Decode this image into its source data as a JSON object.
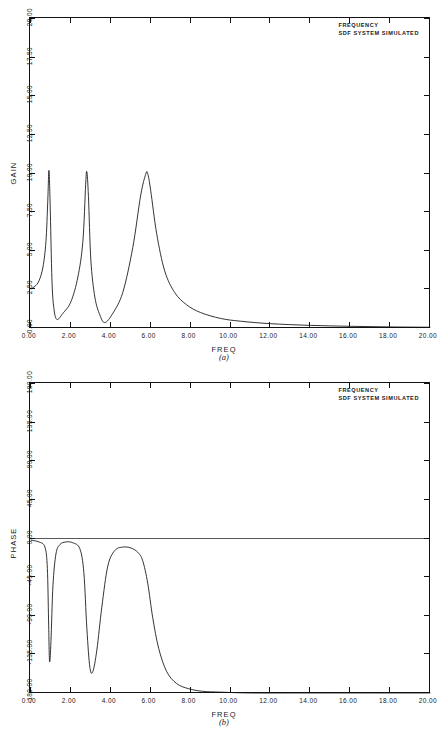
{
  "figure": {
    "caption_a": "(a)",
    "caption_b": "(b)"
  },
  "panel_a": {
    "title_line1": "FREQUENCY",
    "title_line2": "SDF SYSTEM SIMULATED",
    "xlabel": "FREQ",
    "ylabel": "GAIN",
    "xticks": [
      "0.00",
      "2.00",
      "4.00",
      "6.00",
      "8.00",
      "10.00",
      "12.00",
      "14.00",
      "16.00",
      "18.00",
      "20.00"
    ],
    "yticks": [
      "0.00",
      "2.50",
      "5.00",
      "7.50",
      "10.00",
      "12.50",
      "15.00",
      "17.50",
      "20.00"
    ]
  },
  "panel_b": {
    "title_line1": "FREQUENCY",
    "title_line2": "SDF SYSTEM SIMULATED",
    "xlabel": "FREQ",
    "ylabel": "PHASE",
    "xticks": [
      "0.00",
      "2.00",
      "4.00",
      "6.00",
      "8.00",
      "10.00",
      "12.00",
      "14.00",
      "16.00",
      "18.00",
      "20.00"
    ],
    "yticks": [
      "-180.00",
      "-135.00",
      "-90.00",
      "-45.00",
      "0.00",
      "45.00",
      "90.00",
      "135.00",
      "180.00"
    ]
  },
  "chart_data": [
    {
      "type": "line",
      "title": "FREQUENCY / SDF SYSTEM SIMULATED",
      "subtitle": "(a)",
      "xlabel": "FREQ",
      "ylabel": "GAIN",
      "xlim": [
        0.0,
        20.0
      ],
      "ylim": [
        0.0,
        20.0
      ],
      "grid": false,
      "legend": null,
      "series": [
        {
          "name": "GAIN",
          "description": "Frequency response magnitude of a 3-degree-of-freedom system showing three resonance peaks near 0.9, 2.8 and 5.8 rad/s, each reaching about 10, with anti-resonance minima between them and a monotonic roll-off toward zero beyond 8.",
          "resonances": [
            {
              "freq": 0.9,
              "peak_gain": 10.2,
              "half_power_width": 0.16
            },
            {
              "freq": 2.8,
              "peak_gain": 10.1,
              "half_power_width": 0.3
            },
            {
              "freq": 5.8,
              "peak_gain": 10.0,
              "half_power_width": 0.72
            }
          ],
          "antiresonances": [
            {
              "freq": 1.3,
              "gain": 0.55
            },
            {
              "freq": 3.7,
              "gain": 0.35
            }
          ],
          "x": [
            0.0,
            0.2,
            0.4,
            0.6,
            0.75,
            0.84,
            0.9,
            0.96,
            1.05,
            1.15,
            1.3,
            1.6,
            2.0,
            2.35,
            2.6,
            2.74,
            2.8,
            2.88,
            3.0,
            3.2,
            3.45,
            3.7,
            4.1,
            4.6,
            5.1,
            5.5,
            5.75,
            5.85,
            6.0,
            6.3,
            6.7,
            7.2,
            7.8,
            8.5,
            9.5,
            10.5,
            12.0,
            14.0,
            16.0,
            18.0,
            20.0
          ],
          "y": [
            2.55,
            2.7,
            3.05,
            3.95,
            5.6,
            8.2,
            10.2,
            8.0,
            3.1,
            1.25,
            0.55,
            0.95,
            1.7,
            3.3,
            5.6,
            9.3,
            10.1,
            8.5,
            4.4,
            2.0,
            0.85,
            0.35,
            0.95,
            2.3,
            5.2,
            8.6,
            9.95,
            10.0,
            8.9,
            6.1,
            3.7,
            2.3,
            1.5,
            1.0,
            0.62,
            0.44,
            0.28,
            0.17,
            0.11,
            0.07,
            0.05
          ]
        }
      ]
    },
    {
      "type": "line",
      "title": "FREQUENCY / SDF SYSTEM SIMULATED",
      "subtitle": "(b)",
      "xlabel": "FREQ",
      "ylabel": "PHASE",
      "xlim": [
        0.0,
        20.0
      ],
      "ylim": [
        -180.0,
        180.0
      ],
      "grid": false,
      "legend": null,
      "series": [
        {
          "name": "PHASE",
          "description": "Phase response in degrees. Starts near 0, plunges toward -143 at the first resonance and recovers to near 0, plunges to about -155 at the second resonance and recovers, then drops through the third resonance and asymptotes at -180 degrees beyond frequency 8.",
          "x": [
            0.0,
            0.4,
            0.7,
            0.82,
            0.88,
            0.93,
            1.0,
            1.1,
            1.25,
            1.45,
            1.75,
            2.1,
            2.45,
            2.65,
            2.8,
            2.95,
            3.1,
            3.3,
            3.55,
            3.85,
            4.2,
            4.6,
            5.0,
            5.35,
            5.6,
            5.85,
            6.1,
            6.4,
            6.8,
            7.3,
            7.9,
            8.6,
            9.5,
            11.0,
            13.0,
            15.0,
            17.0,
            20.0
          ],
          "y": [
            -2,
            -4,
            -10,
            -35,
            -95,
            -143,
            -120,
            -55,
            -18,
            -7,
            -4,
            -5,
            -12,
            -40,
            -105,
            -150,
            -155,
            -130,
            -80,
            -32,
            -14,
            -10,
            -11,
            -16,
            -26,
            -52,
            -92,
            -128,
            -155,
            -169,
            -175,
            -178,
            -179,
            -180,
            -180,
            -180,
            -180,
            -180
          ]
        }
      ]
    }
  ]
}
